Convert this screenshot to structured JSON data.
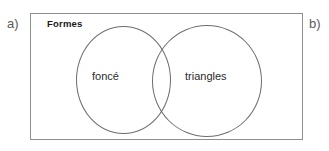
{
  "figure": {
    "part_labels": {
      "left": "a)",
      "right": "b)"
    },
    "universe": {
      "title": "Formes"
    },
    "venn": {
      "sets": [
        {
          "id": "left",
          "label": "foncé"
        },
        {
          "id": "right",
          "label": "triangles"
        }
      ]
    },
    "colors": {
      "background": "#ffffff",
      "box_border": "#8e8e8e",
      "circle_stroke": "#6d6d6d",
      "title_text": "#1a1a1a",
      "set_label_text": "#2a2a2a",
      "part_label_text": "#5b5b5b"
    }
  }
}
